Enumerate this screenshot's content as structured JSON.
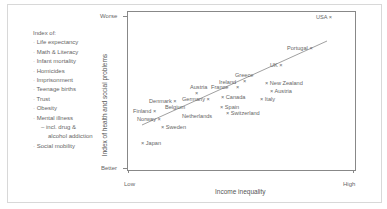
{
  "chart_data": {
    "type": "scatter",
    "title": "",
    "xlabel": "Income inequality",
    "ylabel": "Index of health and social problems",
    "x_ticks": [
      "Low",
      "High"
    ],
    "y_ticks": [
      "Better",
      "Worse"
    ],
    "xlim": [
      0,
      100
    ],
    "ylim": [
      0,
      100
    ],
    "grid": false,
    "legend_position": "left",
    "legend": {
      "title": "Index of:",
      "items": [
        "Life expectancy",
        "Math & Literacy",
        "Infant mortality",
        "Homicides",
        "Imprisonment",
        "Teenage births",
        "Trust",
        "Obesity",
        "Mental illness",
        "– incl. drug &",
        "alcohol addiction",
        "Social mobility"
      ]
    },
    "trend_line": {
      "x1": 7,
      "y1": 28,
      "x2": 89,
      "y2": 82
    },
    "points": [
      {
        "label": "USA",
        "x": 94,
        "y": 98
      },
      {
        "label": "Portugal",
        "x": 85,
        "y": 76
      },
      {
        "label": "UK",
        "x": 70,
        "y": 64
      },
      {
        "label": "Greece",
        "x": 53,
        "y": 56
      },
      {
        "label": "Ireland",
        "x": 49,
        "y": 52
      },
      {
        "label": "New Zealand",
        "x": 67,
        "y": 50
      },
      {
        "label": "Austria",
        "x": 34,
        "y": 48
      },
      {
        "label": "France",
        "x": 45,
        "y": 47
      },
      {
        "label": "Austria",
        "x": 69,
        "y": 46
      },
      {
        "label": "Germany",
        "x": 35,
        "y": 42
      },
      {
        "label": "Canada",
        "x": 48,
        "y": 43
      },
      {
        "label": "Italy",
        "x": 61,
        "y": 41
      },
      {
        "label": "Denmark",
        "x": 22,
        "y": 39
      },
      {
        "label": "Belgium",
        "x": 25,
        "y": 36
      },
      {
        "label": "Spain",
        "x": 45,
        "y": 37
      },
      {
        "label": "Finland",
        "x": 10,
        "y": 35
      },
      {
        "label": "Switzerland",
        "x": 48,
        "y": 33
      },
      {
        "label": "Netherlands",
        "x": 36,
        "y": 31
      },
      {
        "label": "Norway",
        "x": 13,
        "y": 30
      },
      {
        "label": "Sweden",
        "x": 15,
        "y": 26
      },
      {
        "label": "Japan",
        "x": 3,
        "y": 14
      }
    ]
  },
  "labels": {
    "legend_title": "Index of:",
    "legend_items": [
      "Life expectancy",
      "Math & Literacy",
      "Infant mortality",
      "Homicides",
      "Imprisonment",
      "Teenage births",
      "Trust",
      "Obesity",
      "Mental illness",
      "– incl. drug &",
      "alcohol addiction",
      "Social mobility"
    ],
    "y_worse": "Worse",
    "y_better": "Better",
    "x_low": "Low",
    "x_high": "High",
    "xlabel": "Income inequality",
    "ylabel": "Index of health and social problems"
  },
  "points_display": [
    {
      "text": "USA ×",
      "left": 316,
      "top": 14
    },
    {
      "text": "Portugal ×",
      "left": 287,
      "top": 45
    },
    {
      "text": "UK ×",
      "left": 270,
      "top": 62
    },
    {
      "text": "Greece",
      "left": 235,
      "top": 72
    },
    {
      "text": "×",
      "left": 243,
      "top": 78
    },
    {
      "text": "Ireland",
      "left": 219,
      "top": 79
    },
    {
      "text": "×",
      "left": 236,
      "top": 84
    },
    {
      "text": "× New Zealand",
      "left": 265,
      "top": 80
    },
    {
      "text": "Austria",
      "left": 190,
      "top": 84
    },
    {
      "text": "France",
      "left": 211,
      "top": 84
    },
    {
      "text": "× Austria",
      "left": 270,
      "top": 88
    },
    {
      "text": "×",
      "left": 195,
      "top": 90
    },
    {
      "text": "Germany ×",
      "left": 182,
      "top": 96
    },
    {
      "text": "× Canada",
      "left": 221,
      "top": 94
    },
    {
      "text": "× Italy",
      "left": 260,
      "top": 96
    },
    {
      "text": "Denmark ×",
      "left": 149,
      "top": 98
    },
    {
      "text": "Belgium",
      "left": 165,
      "top": 104
    },
    {
      "text": "× Spain",
      "left": 220,
      "top": 104
    },
    {
      "text": "Finland ×",
      "left": 133,
      "top": 108
    },
    {
      "text": "× Switzerland",
      "left": 226,
      "top": 110
    },
    {
      "text": "Netherlands",
      "left": 182,
      "top": 113
    },
    {
      "text": "Norway ×",
      "left": 137,
      "top": 116
    },
    {
      "text": "× Sweden",
      "left": 161,
      "top": 124
    },
    {
      "text": "× Japan",
      "left": 141,
      "top": 140
    }
  ]
}
